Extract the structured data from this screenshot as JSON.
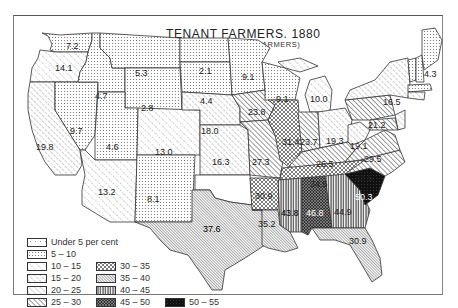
{
  "header": {
    "title": "TENANT FARMERS. 1880",
    "subtitle": "(PERCENTAGE OF ALL FARMERS)"
  },
  "legend": {
    "items": [
      {
        "label": "Under 5 per cent",
        "range": [
          0,
          5
        ],
        "pattern": "sparse-dots"
      },
      {
        "label": "5 – 10",
        "range": [
          5,
          10
        ],
        "pattern": "dense-dots"
      },
      {
        "label": "10 – 15",
        "range": [
          10,
          15
        ],
        "pattern": "dotted-diagonal"
      },
      {
        "label": "15 – 20",
        "range": [
          15,
          20
        ],
        "pattern": "dashed-diagonal"
      },
      {
        "label": "20 – 25",
        "range": [
          20,
          25
        ],
        "pattern": "light-diagonal"
      },
      {
        "label": "25 – 30",
        "range": [
          25,
          30
        ],
        "pattern": "bold-diagonal"
      },
      {
        "label": "30 – 35",
        "range": [
          30,
          35
        ],
        "pattern": "crosshatch"
      },
      {
        "label": "35 – 40",
        "range": [
          35,
          40
        ],
        "pattern": "fine-diagonal"
      },
      {
        "label": "40 – 45",
        "range": [
          40,
          45
        ],
        "pattern": "vertical-lines"
      },
      {
        "label": "45 – 50",
        "range": [
          45,
          50
        ],
        "pattern": "dark-crosshatch"
      },
      {
        "label": "50 – 55",
        "range": [
          50,
          55
        ],
        "pattern": "solid-dark"
      }
    ]
  },
  "states": [
    {
      "name": "Washington",
      "value": "7.2"
    },
    {
      "name": "Oregon",
      "value": "14.1"
    },
    {
      "name": "California",
      "value": "19.8"
    },
    {
      "name": "Nevada",
      "value": "9.7"
    },
    {
      "name": "Idaho",
      "value": "4.7"
    },
    {
      "name": "Montana",
      "value": "5.3"
    },
    {
      "name": "Wyoming",
      "value": "2.8"
    },
    {
      "name": "Utah",
      "value": "4.6"
    },
    {
      "name": "Arizona",
      "value": "13.2"
    },
    {
      "name": "Colorado",
      "value": "13.0"
    },
    {
      "name": "New Mexico",
      "value": "8.1"
    },
    {
      "name": "North Dakota",
      "value": "2.1"
    },
    {
      "name": "South Dakota",
      "value": "4.4"
    },
    {
      "name": "Nebraska",
      "value": "18.0"
    },
    {
      "name": "Kansas",
      "value": "16.3"
    },
    {
      "name": "Texas",
      "value": "37.6"
    },
    {
      "name": "Minnesota",
      "value": "9.1"
    },
    {
      "name": "Iowa",
      "value": "23.8"
    },
    {
      "name": "Missouri",
      "value": "27.3"
    },
    {
      "name": "Arkansas",
      "value": "30.9"
    },
    {
      "name": "Louisiana",
      "value": "35.2"
    },
    {
      "name": "Wisconsin",
      "value": "9.1"
    },
    {
      "name": "Michigan",
      "value": "10.0"
    },
    {
      "name": "Illinois",
      "value": "31.4"
    },
    {
      "name": "Indiana",
      "value": "23.7"
    },
    {
      "name": "Ohio",
      "value": "19.3"
    },
    {
      "name": "Kentucky",
      "value": "26.5"
    },
    {
      "name": "Tennessee",
      "value": "34.5"
    },
    {
      "name": "Mississippi",
      "value": "43.8"
    },
    {
      "name": "Alabama",
      "value": "46.8"
    },
    {
      "name": "Georgia",
      "value": "44.9"
    },
    {
      "name": "Florida",
      "value": "30.9"
    },
    {
      "name": "South Carolina",
      "value": "50.3"
    },
    {
      "name": "North Carolina",
      "value": "33.5"
    },
    {
      "name": "Virginia",
      "value": "29.5"
    },
    {
      "name": "West Virginia",
      "value": "19.1"
    },
    {
      "name": "Pennsylvania",
      "value": "21.2"
    },
    {
      "name": "New York",
      "value": "16.5"
    },
    {
      "name": "Maine",
      "value": "4.3"
    }
  ]
}
